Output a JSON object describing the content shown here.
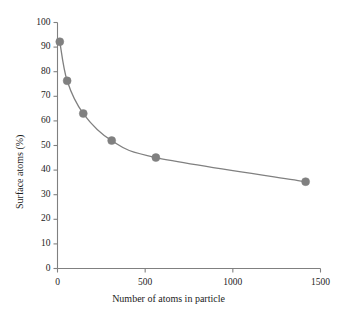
{
  "chart_data": {
    "type": "line",
    "title": "",
    "subtitle": "",
    "xlabel": "Number of atoms in particle",
    "ylabel": "Surface atoms (%)",
    "xlim": [
      0,
      1500
    ],
    "ylim": [
      0,
      100
    ],
    "xticks": [
      0,
      500,
      1000,
      1500
    ],
    "yticks": [
      0,
      10,
      20,
      30,
      40,
      50,
      60,
      70,
      80,
      90,
      100
    ],
    "xtick_labels": [
      "0",
      "500",
      "1000",
      "1500"
    ],
    "ytick_labels": [
      "0",
      "10",
      "20",
      "30",
      "40",
      "50",
      "60",
      "70",
      "80",
      "90",
      "100"
    ],
    "grid": false,
    "legend": false,
    "legend_position": "none",
    "marker": "circle",
    "series": [
      {
        "name": "Surface atoms fraction",
        "color": "#808080",
        "x": [
          13,
          55,
          147,
          309,
          561,
          1415
        ],
        "y": [
          92.2,
          76.3,
          63.0,
          52.0,
          45.1,
          35.3
        ]
      }
    ]
  },
  "style": {
    "axis_color": "#808080",
    "line_color": "#808080",
    "marker_color": "#808080",
    "text_color": "#1c1c1c",
    "background": "#ffffff"
  },
  "axis_titles": {
    "x": "Number of atoms in particle",
    "y": "Surface atoms (%)"
  }
}
